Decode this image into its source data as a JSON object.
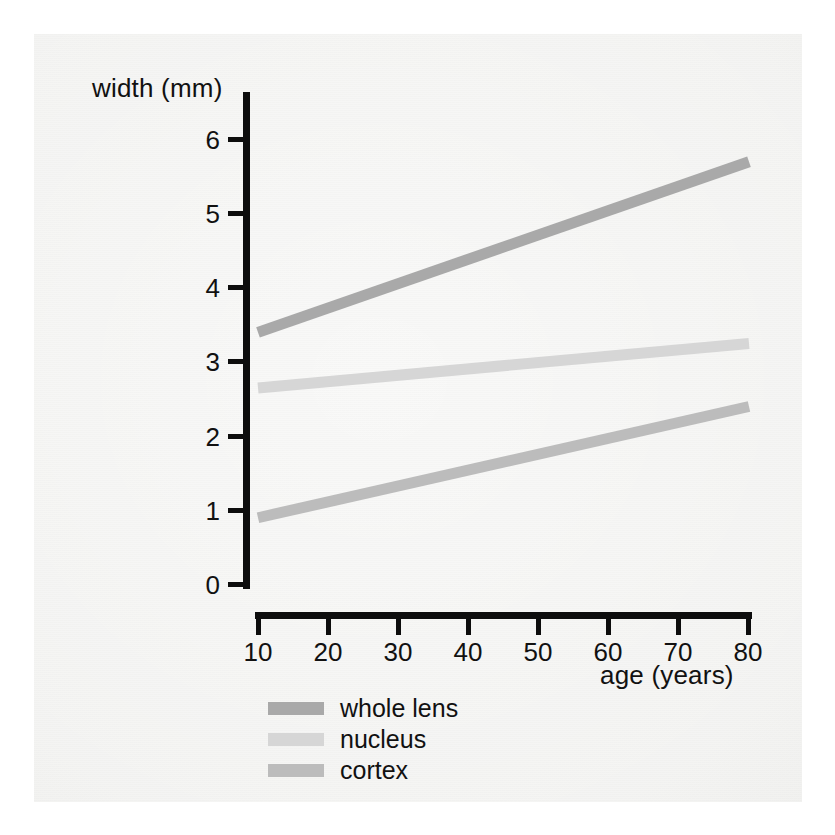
{
  "chart_data": {
    "type": "line",
    "title": "",
    "xlabel": "age (years)",
    "ylabel": "width (mm)",
    "xlim": [
      10,
      80
    ],
    "ylim": [
      0,
      6
    ],
    "x": [
      10,
      80
    ],
    "xticks": [
      "10",
      "20",
      "30",
      "40",
      "50",
      "60",
      "70",
      "80"
    ],
    "yticks": [
      "0",
      "1",
      "2",
      "3",
      "4",
      "5",
      "6"
    ],
    "grid": false,
    "legend_position": "below-plot-left",
    "series": [
      {
        "name": "whole lens",
        "values": [
          3.4,
          5.7
        ],
        "color": "#a9a9a9"
      },
      {
        "name": "nucleus",
        "values": [
          2.65,
          3.25
        ],
        "color": "#d6d6d6"
      },
      {
        "name": "cortex",
        "values": [
          0.9,
          2.4
        ],
        "color": "#bcbcbc"
      }
    ]
  },
  "axes": {
    "y_title": "width (mm)",
    "x_title": "age (years)",
    "y_tick_labels": [
      "6",
      "5",
      "4",
      "3",
      "2",
      "1",
      "0"
    ],
    "x_tick_labels": [
      "10",
      "20",
      "30",
      "40",
      "50",
      "60",
      "70",
      "80"
    ],
    "axis_color": "#0d0d0d"
  },
  "legend": {
    "items": [
      {
        "label": "whole lens",
        "color": "#a9a9a9"
      },
      {
        "label": "nucleus",
        "color": "#d6d6d6"
      },
      {
        "label": "cortex",
        "color": "#bcbcbc"
      }
    ]
  },
  "page": {
    "background": "#ffffff",
    "scan_background": "#f2f2f0"
  }
}
